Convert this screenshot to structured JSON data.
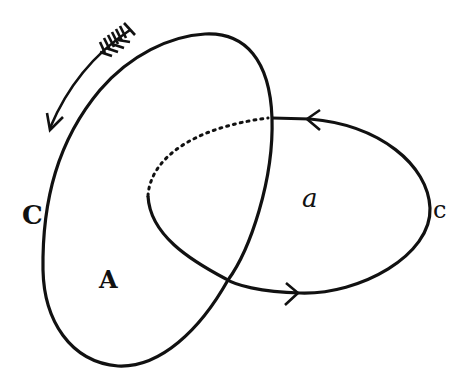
{
  "diagram": {
    "labels": {
      "outer_contour": "C",
      "outer_region": "A",
      "inner_region": "a",
      "inner_contour": "c"
    },
    "colors": {
      "stroke": "#111111",
      "background": "#ffffff"
    },
    "elements": [
      {
        "type": "closed-curve",
        "name": "contour C",
        "encloses": "A"
      },
      {
        "type": "loop",
        "name": "contour c",
        "encloses": "a",
        "linked_with": "C",
        "hidden_part": "dotted"
      },
      {
        "type": "arrow",
        "name": "circulation direction",
        "direction": "counter-clockwise along C"
      }
    ]
  }
}
